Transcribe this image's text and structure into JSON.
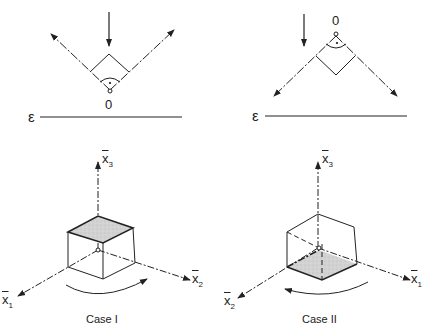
{
  "figure": {
    "panels": [
      {
        "id": "case-1",
        "caption": "Case I",
        "reflection": {
          "origin_label": "0",
          "surface_label": "ε",
          "description": "Incident ray from above; reflected rays go up-left and up-right from origin 0 below the right-angle corner"
        },
        "axes": {
          "x1": {
            "symbol": "x",
            "sub": "1"
          },
          "x2": {
            "symbol": "x",
            "sub": "2"
          },
          "x3": {
            "symbol": "x",
            "sub": "3"
          }
        },
        "shaded_face": "top",
        "rotation_arrow": "clockwise-right"
      },
      {
        "id": "case-2",
        "caption": "Case II",
        "reflection": {
          "origin_label": "0",
          "surface_label": "ε",
          "description": "Incident ray from above; reflected rays go down-left and down-right from origin 0 above the right-angle corner"
        },
        "axes": {
          "x1": {
            "symbol": "x",
            "sub": "1"
          },
          "x2": {
            "symbol": "x",
            "sub": "2"
          },
          "x3": {
            "symbol": "x",
            "sub": "3"
          }
        },
        "shaded_face": "bottom",
        "rotation_arrow": "counterclockwise-left"
      }
    ],
    "colors": {
      "line": "#222222",
      "shade": "#cfcfcf",
      "background": "#ffffff"
    }
  }
}
